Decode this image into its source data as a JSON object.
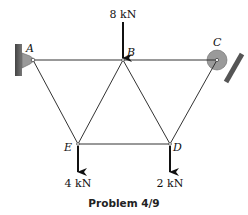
{
  "caption": "Problem 4/9",
  "nodes": {
    "A": {
      "label": "A"
    },
    "B": {
      "label": "B"
    },
    "C": {
      "label": "C"
    },
    "D": {
      "label": "D"
    },
    "E": {
      "label": "E"
    }
  },
  "loads": {
    "B": "8 kN",
    "E": "4 kN",
    "D": "2 kN"
  },
  "members": [
    "AB",
    "BC",
    "AE",
    "BE",
    "BD",
    "ED",
    "CD"
  ],
  "colors": {
    "member": "#333333",
    "support_fill": "#9a9a9a",
    "wall": "#555555",
    "arrow": "#111111"
  }
}
